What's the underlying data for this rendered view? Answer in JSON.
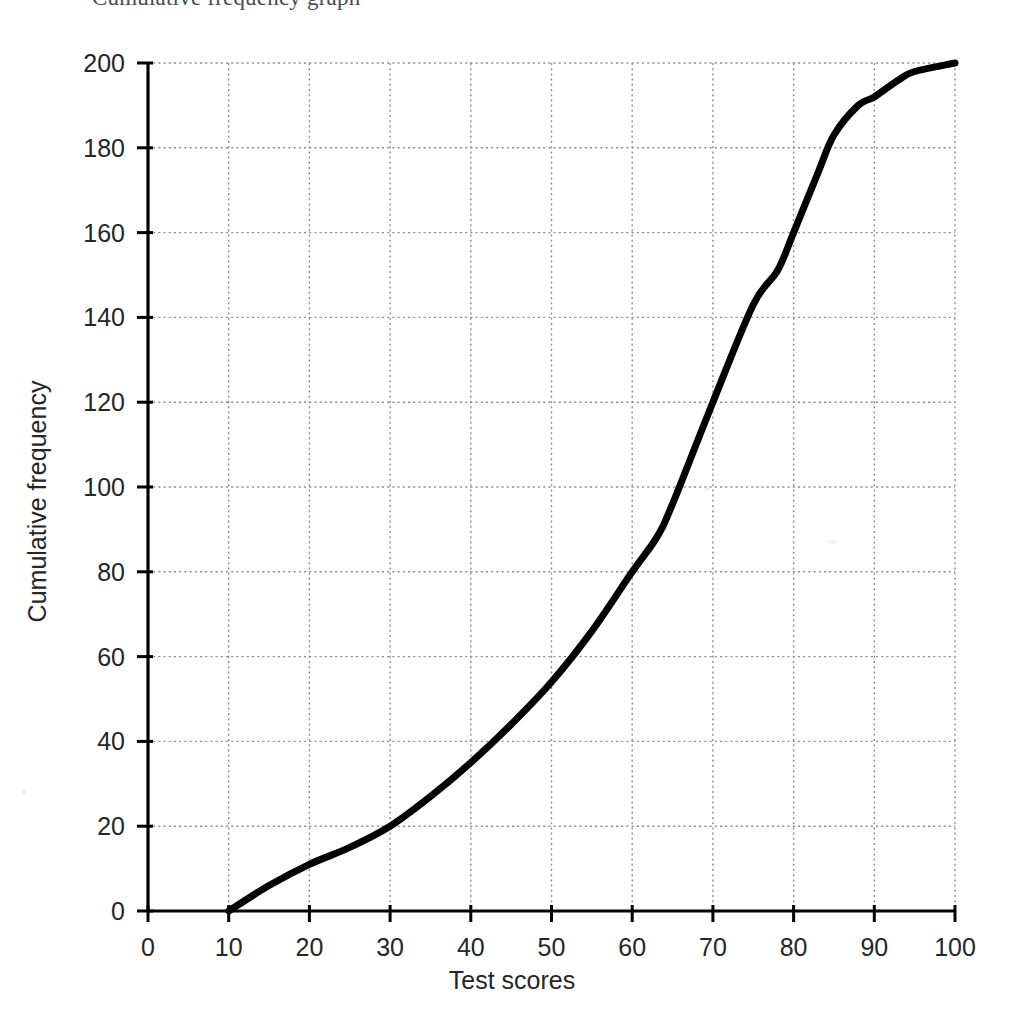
{
  "page": {
    "cropped_heading": "Cumulative frequency graph",
    "background_color": "#ffffff"
  },
  "chart_data": {
    "type": "line",
    "title": "",
    "xlabel": "Test scores",
    "ylabel": "Cumulative frequency",
    "xlim": [
      0,
      100
    ],
    "ylim": [
      0,
      200
    ],
    "xticks": [
      0,
      10,
      20,
      30,
      40,
      50,
      60,
      70,
      80,
      90,
      100
    ],
    "yticks": [
      0,
      20,
      40,
      60,
      80,
      100,
      120,
      140,
      160,
      180,
      200
    ],
    "xtick_labels": [
      "0",
      "10",
      "20",
      "30",
      "40",
      "50",
      "60",
      "70",
      "80",
      "90",
      "100"
    ],
    "ytick_labels": [
      "0",
      "20",
      "40",
      "60",
      "80",
      "100",
      "120",
      "140",
      "160",
      "180",
      "200"
    ],
    "grid": true,
    "grid_style": "dotted",
    "grid_color": "#8c8c8c",
    "legend": false,
    "line_color": "#000000",
    "line_width": 7,
    "series": [
      {
        "name": "Cumulative frequency",
        "x": [
          10,
          15,
          20,
          25,
          30,
          35,
          40,
          45,
          50,
          55,
          60,
          63,
          65,
          70,
          75,
          78,
          80,
          83,
          85,
          88,
          90,
          93,
          95,
          100
        ],
        "y": [
          0,
          6,
          11,
          15,
          20,
          27,
          35,
          44,
          54,
          66,
          80,
          88,
          96,
          120,
          143,
          151,
          160,
          174,
          183,
          190,
          192,
          196,
          198,
          200
        ]
      }
    ],
    "annotations": []
  },
  "axes": {
    "x_axis_name": "x-axis",
    "y_axis_name": "y-axis"
  }
}
